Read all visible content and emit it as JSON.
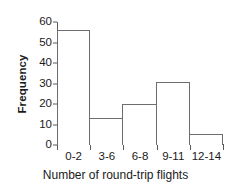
{
  "chart_data": {
    "type": "bar",
    "title": "",
    "categories": [
      "0-2",
      "3-6",
      "6-8",
      "9-11",
      "12-14"
    ],
    "values": [
      56,
      13,
      20,
      30.5,
      5.5
    ],
    "xlabel": "Number of round-trip flights",
    "ylabel": "Frequency",
    "ylim": [
      0,
      60
    ],
    "yticks": [
      0,
      10,
      20,
      30,
      40,
      50,
      60
    ],
    "ytick_labels": [
      "0",
      "10",
      "20",
      "30",
      "40",
      "50",
      "60"
    ],
    "grid": false,
    "legend": false,
    "bar_fill_color": "#ffffff",
    "bar_edge_color": "#6d6d6f",
    "axis_color": "#59595b",
    "text_color": "#1a1a1a",
    "background_color": "#ffffff"
  }
}
